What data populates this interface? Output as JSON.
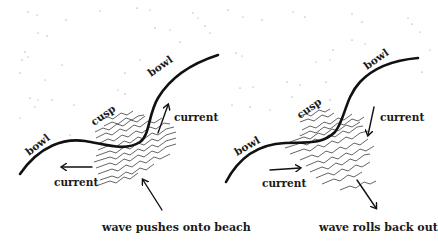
{
  "figure": {
    "panels": [
      {
        "id": "left",
        "labels": {
          "bowl_upper": "bowl",
          "bowl_lower": "bowl",
          "cusp": "cusp",
          "current_right": "current",
          "current_left": "current"
        },
        "caption": "wave pushes onto beach",
        "current_arrows": [
          "up-right toward upper bowl",
          "left toward lower bowl"
        ],
        "wave_arrow": "pointing up-left toward shore"
      },
      {
        "id": "right",
        "labels": {
          "bowl_upper": "bowl",
          "bowl_lower": "bowl",
          "cusp": "cusp",
          "current_right": "current",
          "current_left": "current"
        },
        "caption": "wave rolls back out",
        "current_arrows": [
          "down from upper bowl",
          "right from lower bowl"
        ],
        "wave_arrow": "pointing down-right away from shore"
      }
    ],
    "colors": {
      "ink": "#111111",
      "background": "#ffffff",
      "sand_dots": "#777777"
    }
  }
}
